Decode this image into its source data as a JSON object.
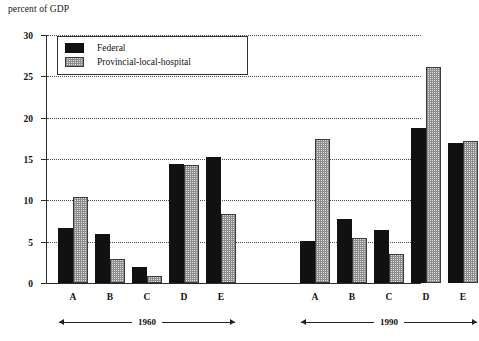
{
  "chart_data": {
    "type": "bar",
    "title": "percent of GDP",
    "xlabel": "",
    "ylabel": "percent of GDP",
    "ylim": [
      0,
      30
    ],
    "yticks": [
      0,
      5,
      10,
      15,
      20,
      25,
      30
    ],
    "grid": true,
    "legend_position": "upper-left-inside",
    "categories": [
      "A",
      "B",
      "C",
      "D",
      "E",
      "A",
      "B",
      "C",
      "D",
      "E"
    ],
    "groups": [
      {
        "label": "1960",
        "categories": [
          "A",
          "B",
          "C",
          "D",
          "E"
        ],
        "series": [
          {
            "name": "Federal",
            "values": [
              6.7,
              5.9,
              1.9,
              14.4,
              15.3
            ]
          },
          {
            "name": "Provincial-local-hospital",
            "values": [
              10.4,
              2.9,
              0.9,
              14.3,
              8.4
            ]
          }
        ]
      },
      {
        "label": "1990",
        "categories": [
          "A",
          "B",
          "C",
          "D",
          "E"
        ],
        "series": [
          {
            "name": "Federal",
            "values": [
              5.1,
              7.8,
              6.4,
              18.8,
              16.9
            ]
          },
          {
            "name": "Provincial-local-hospital",
            "values": [
              17.4,
              5.4,
              3.5,
              26.1,
              17.2
            ]
          }
        ]
      }
    ],
    "series": [
      {
        "name": "Federal",
        "color": "#111111",
        "values": [
          6.7,
          5.9,
          1.9,
          14.4,
          15.3,
          5.1,
          7.8,
          6.4,
          18.8,
          16.9
        ]
      },
      {
        "name": "Provincial-local-hospital",
        "color": "#dedede",
        "values": [
          10.4,
          2.9,
          0.9,
          14.3,
          8.4,
          17.4,
          5.4,
          3.5,
          26.1,
          17.2
        ]
      }
    ]
  },
  "legend": {
    "items": [
      {
        "label": "Federal"
      },
      {
        "label": "Provincial-local-hospital"
      }
    ]
  },
  "axis": {
    "title": "percent of GDP",
    "tick_labels": [
      "30",
      "25",
      "20",
      "15",
      "10",
      "5",
      "0"
    ]
  },
  "eras": [
    {
      "label": "1960"
    },
    {
      "label": "1990"
    }
  ]
}
